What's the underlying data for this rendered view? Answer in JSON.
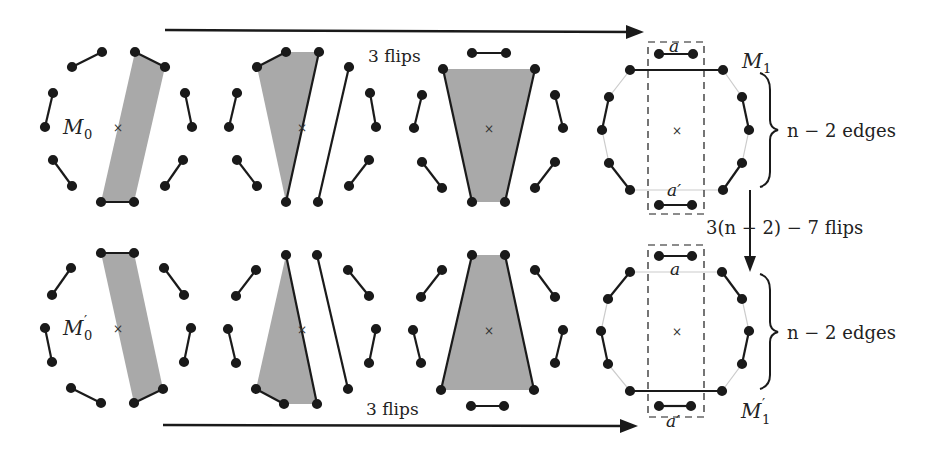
{
  "figure": {
    "top_arrow_label": "3 flips",
    "bottom_arrow_label": "3 flips",
    "vertical_arrow_label": "3(n − 2) − 7 flips",
    "brace_top_label": "n − 2 edges",
    "brace_bottom_label": "n − 2 edges",
    "matchings": {
      "m0": "M",
      "m0_sub": "0",
      "m0p": "M",
      "m0p_sub": "0",
      "m0p_prime": "′",
      "m1": "M",
      "m1_sub": "1",
      "m1p": "M",
      "m1p_sub": "1",
      "m1p_prime": "′"
    },
    "edge_labels": {
      "a_top": "a",
      "a_prime_top": "a′",
      "a_bottom": "a",
      "a_prime_bottom": "a′"
    },
    "colors": {
      "ink": "#1a1a1a",
      "fill": "#a9a9a9",
      "faint": "#cccccc"
    }
  }
}
